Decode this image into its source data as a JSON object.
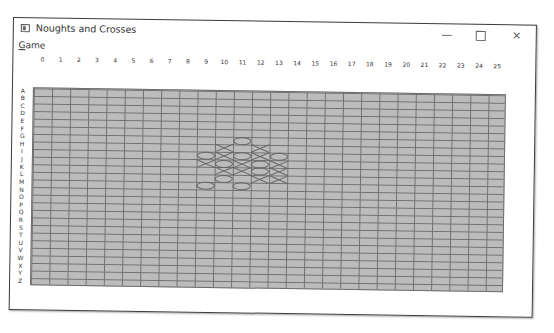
{
  "window": {
    "title": "Noughts and Crosses",
    "icon": "app-window-icon",
    "controls": {
      "minimize": "—",
      "maximize": "□",
      "close": "✕"
    }
  },
  "menubar": {
    "items": [
      {
        "label": "Game",
        "mnemonic": "G"
      }
    ]
  },
  "board": {
    "columns": [
      "0",
      "1",
      "2",
      "3",
      "4",
      "5",
      "6",
      "7",
      "8",
      "9",
      "10",
      "11",
      "12",
      "13",
      "14",
      "15",
      "16",
      "17",
      "18",
      "19",
      "20",
      "21",
      "22",
      "23",
      "24",
      "25"
    ],
    "rows": [
      "A",
      "B",
      "C",
      "D",
      "E",
      "F",
      "G",
      "H",
      "I",
      "J",
      "K",
      "L",
      "M",
      "N",
      "O",
      "P",
      "Q",
      "R",
      "S",
      "T",
      "U",
      "V",
      "W",
      "X",
      "Y",
      "Z"
    ],
    "colors": {
      "cell": "#bcbcbc",
      "grid": "#707070",
      "mark": "#666666"
    },
    "pieces": [
      {
        "row": "G",
        "col": 11,
        "mark": "O"
      },
      {
        "row": "H",
        "col": 10,
        "mark": "X"
      },
      {
        "row": "H",
        "col": 12,
        "mark": "X"
      },
      {
        "row": "I",
        "col": 9,
        "mark": "O"
      },
      {
        "row": "I",
        "col": 10,
        "mark": "X"
      },
      {
        "row": "I",
        "col": 11,
        "mark": "O"
      },
      {
        "row": "I",
        "col": 12,
        "mark": "X"
      },
      {
        "row": "I",
        "col": 13,
        "mark": "O"
      },
      {
        "row": "J",
        "col": 9,
        "mark": "X"
      },
      {
        "row": "J",
        "col": 10,
        "mark": "O"
      },
      {
        "row": "J",
        "col": 11,
        "mark": "X"
      },
      {
        "row": "J",
        "col": 12,
        "mark": "O"
      },
      {
        "row": "J",
        "col": 13,
        "mark": "X"
      },
      {
        "row": "K",
        "col": 10,
        "mark": "X"
      },
      {
        "row": "K",
        "col": 11,
        "mark": "X"
      },
      {
        "row": "K",
        "col": 12,
        "mark": "O"
      },
      {
        "row": "K",
        "col": 13,
        "mark": "X"
      },
      {
        "row": "L",
        "col": 10,
        "mark": "O"
      },
      {
        "row": "L",
        "col": 12,
        "mark": "X"
      },
      {
        "row": "L",
        "col": 13,
        "mark": "X"
      },
      {
        "row": "M",
        "col": 9,
        "mark": "O"
      },
      {
        "row": "M",
        "col": 11,
        "mark": "O"
      }
    ]
  }
}
